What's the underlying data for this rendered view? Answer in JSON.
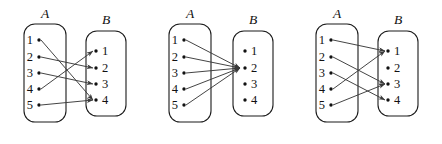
{
  "figure": {
    "background_color": "#ffffff",
    "line_color": "#3a3a3a",
    "box_stroke_color": "#1b1b1b",
    "text_color": "#111111",
    "set_a_label": "A",
    "set_b_label": "B",
    "domain_elements": [
      "1",
      "2",
      "3",
      "4",
      "5"
    ],
    "codomain_elements": [
      "1",
      "2",
      "3",
      "4"
    ],
    "diagrams": [
      {
        "id": "diagram-1",
        "index": "1",
        "source_label": "A",
        "target_label": "B",
        "source_elements": [
          "1",
          "2",
          "3",
          "4",
          "5"
        ],
        "target_elements": [
          "1",
          "2",
          "3",
          "4"
        ],
        "mappings": [
          {
            "from": "1",
            "to": "4"
          },
          {
            "from": "2",
            "to": "2"
          },
          {
            "from": "3",
            "to": "3"
          },
          {
            "from": "4",
            "to": "1"
          },
          {
            "from": "5",
            "to": "4"
          }
        ]
      },
      {
        "id": "diagram-2",
        "index": "2",
        "source_label": "A",
        "target_label": "B",
        "source_elements": [
          "1",
          "2",
          "3",
          "4",
          "5"
        ],
        "target_elements": [
          "1",
          "2",
          "3",
          "4"
        ],
        "mappings": [
          {
            "from": "1",
            "to": "2"
          },
          {
            "from": "2",
            "to": "2"
          },
          {
            "from": "3",
            "to": "2"
          },
          {
            "from": "4",
            "to": "2"
          },
          {
            "from": "5",
            "to": "2"
          }
        ]
      },
      {
        "id": "diagram-3",
        "index": "3",
        "source_label": "A",
        "target_label": "B",
        "source_elements": [
          "1",
          "2",
          "3",
          "4",
          "5"
        ],
        "target_elements": [
          "1",
          "2",
          "3",
          "4"
        ],
        "mappings": [
          {
            "from": "1",
            "to": "1"
          },
          {
            "from": "2",
            "to": "3"
          },
          {
            "from": "3",
            "to": "4"
          },
          {
            "from": "4",
            "to": "1"
          },
          {
            "from": "5",
            "to": "3"
          }
        ]
      }
    ]
  }
}
